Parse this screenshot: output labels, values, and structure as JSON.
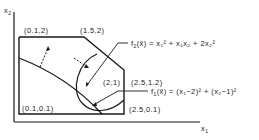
{
  "axes": {
    "x_label": "x",
    "x_sub": "1",
    "y_label": "x",
    "y_sub": "2"
  },
  "vertices": [
    {
      "id": "top-left",
      "label": "(0.1,2)"
    },
    {
      "id": "top-mid",
      "label": "(1.5,2)"
    },
    {
      "id": "right-upper",
      "label": "(2.5,1.2)"
    },
    {
      "id": "bottom-left",
      "label": "(0.1,0.1)"
    },
    {
      "id": "bottom-right",
      "label": "(2.5,0.1)"
    },
    {
      "id": "center",
      "label": "(2,1)"
    }
  ],
  "functions": {
    "f2": {
      "name": "f",
      "sub": "2",
      "expr": "(x̄) = x₁² + x₁x₂ + 2x₂²"
    },
    "f1": {
      "name": "f",
      "sub": "1",
      "expr": "(x̄) = (x₁−2)² + (x₂−1)²"
    }
  },
  "colors": {
    "ink": "#1a1a1a",
    "background": "#ffffff"
  }
}
